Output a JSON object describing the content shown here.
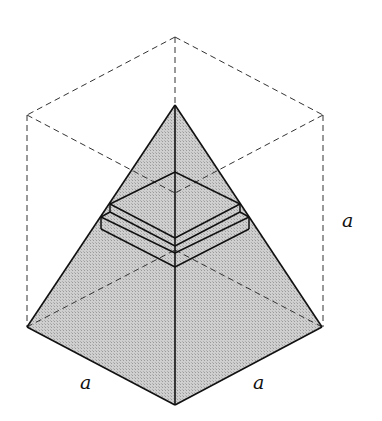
{
  "diagram": {
    "labels": {
      "base_left_edge": "a",
      "base_right_edge": "a",
      "height_edge": "a"
    },
    "colors": {
      "fill": "#c8c8c8",
      "stroke": "#111111",
      "dashed": "#333333",
      "background": "#ffffff"
    }
  }
}
